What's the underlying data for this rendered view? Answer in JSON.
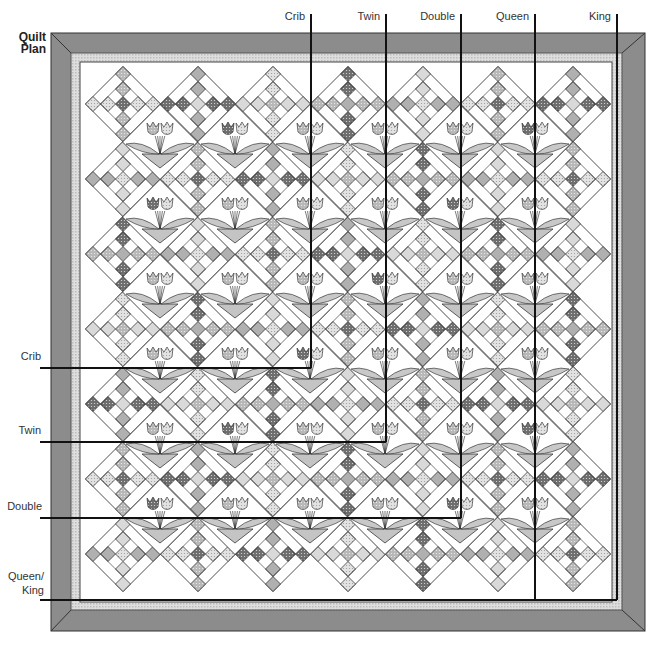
{
  "title": {
    "line1": "Quilt",
    "line2": "Plan"
  },
  "colors": {
    "outer_border": "#8c8c8c",
    "outer_border_edge": "#333333",
    "inner_strip": "#d6d6d6",
    "background": "#ffffff",
    "line": "#222222",
    "square_light": "#d9d9d9",
    "square_mid": "#b0b0b0",
    "square_dark": "#7a7a7a",
    "leaf": "#c8c8c8",
    "pot": "#c4c4c4",
    "petal_dark": "#8a8a8a",
    "petal_light": "#e6e6e6",
    "size_line": "#111111"
  },
  "quilt": {
    "outer": {
      "x": 51,
      "y": 33,
      "w": 594,
      "h": 598
    },
    "inner": {
      "x": 71,
      "y": 53,
      "w": 551,
      "h": 557
    },
    "field": {
      "x": 80,
      "y": 62,
      "w": 532,
      "h": 540
    },
    "block_pitch": 75,
    "cross_columns_x": [
      123,
      198,
      273,
      348,
      423,
      498,
      573
    ],
    "cross_rows_y": [
      104,
      179,
      254,
      329,
      404,
      479,
      554
    ],
    "flower_columns_x": [
      160,
      235,
      310,
      385,
      460,
      535
    ],
    "flower_rows_y": [
      142,
      217,
      292,
      367,
      442,
      517
    ]
  },
  "size_lines": {
    "top_labels": [
      {
        "label": "Crib",
        "x": 311,
        "label_right": 305,
        "y_end": 368
      },
      {
        "label": "Twin",
        "x": 386,
        "label_right": 380,
        "y_end": 442
      },
      {
        "label": "Double",
        "x": 461,
        "label_right": 455,
        "y_end": 518
      },
      {
        "label": "Queen",
        "x": 535,
        "label_right": 529,
        "y_end": 600
      },
      {
        "label": "King",
        "x": 617,
        "label_right": 611,
        "y_end": 600
      }
    ],
    "left_labels": [
      {
        "label": "Crib",
        "y": 368,
        "x_end": 311
      },
      {
        "label": "Twin",
        "y": 442,
        "x_end": 386
      },
      {
        "label": "Double",
        "y": 518,
        "x_end": 461
      },
      {
        "label": "Queen/\nKing",
        "y": 600,
        "x_end": 617
      }
    ],
    "top_y_start": 8,
    "left_x_start": 40
  },
  "labels": {
    "top": [
      "Crib",
      "Twin",
      "Double",
      "Queen",
      "King"
    ],
    "left": [
      "Crib",
      "Twin",
      "Double",
      "Queen/",
      "King"
    ]
  }
}
